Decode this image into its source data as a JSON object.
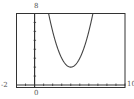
{
  "chart_data": {
    "type": "line",
    "title": "",
    "xlabel": "",
    "ylabel": "",
    "xlim": [
      -2,
      10
    ],
    "ylim": [
      0,
      8
    ],
    "grid": false,
    "legend": null,
    "x_tick_step": 1,
    "y_tick_step": 1,
    "window_labels": {
      "xmin": "-2",
      "xmax": "10",
      "ymax": "8",
      "origin": "0"
    },
    "series": [
      {
        "name": "parabola",
        "function": "y = (x - 4)^2 + 2",
        "vertex": [
          4,
          2
        ],
        "x": [
          1.55,
          2,
          2.5,
          3,
          3.5,
          4,
          4.5,
          5,
          5.5,
          6,
          6.45
        ],
        "values": [
          8,
          6,
          4.25,
          3,
          2.25,
          2,
          2.25,
          3,
          4.25,
          6,
          8
        ]
      }
    ]
  },
  "colors": {
    "frame": "#333333",
    "axis": "#333333",
    "curve": "#444444",
    "label": "#555555"
  }
}
